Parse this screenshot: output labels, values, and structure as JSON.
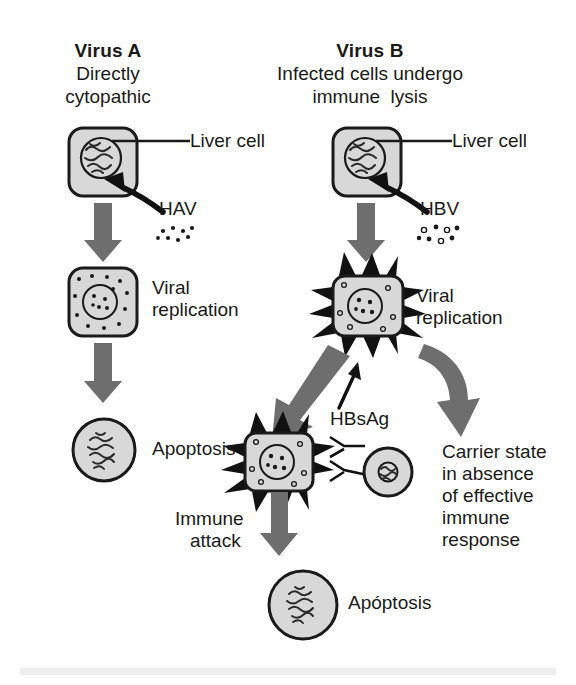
{
  "diagram": {
    "title_left": "Virus A",
    "title_right": "Virus B",
    "subtitle_left_line1": "Directly",
    "subtitle_left_line2": "cytopathic",
    "subtitle_right_line1": "Infected cells undergo",
    "subtitle_right_line2": "immune  lysis",
    "labels": {
      "liver_cell_left": "Liver cell",
      "liver_cell_right": "Liver cell",
      "hav": "HAV",
      "hbv": "HBV",
      "viral_replication_left_l1": "Viral",
      "viral_replication_left_l2": "replication",
      "viral_replication_right_l1": "Viral",
      "viral_replication_right_l2": "replication",
      "apoptosis_left": "Apoptosis",
      "apoptosis_bottom": "Apóptosis",
      "hbsag": "HBsAg",
      "immune_attack_l1": "Immune",
      "immune_attack_l2": "attack",
      "carrier_l1": "Carrier state",
      "carrier_l2": "in absence",
      "carrier_l3": "of effective",
      "carrier_l4": "immune",
      "carrier_l5": "response"
    },
    "colors": {
      "cell_fill": "#d8d8d8",
      "outline": "#1a1a1a",
      "arrow_gray": "#6e6e6e",
      "background": "#ffffff",
      "footer_bar": "#eeeeee"
    }
  }
}
